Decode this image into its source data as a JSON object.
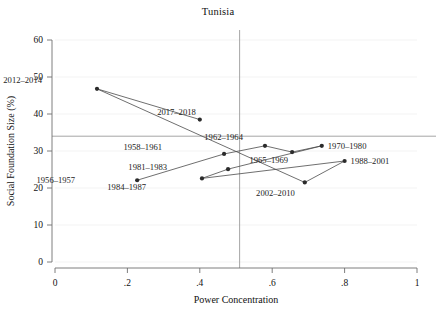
{
  "chart_data": {
    "type": "scatter",
    "title": "Tunisia",
    "xlabel": "Power Concentration",
    "ylabel": "Social Foundation Size (%)",
    "xlim": [
      0,
      1
    ],
    "ylim": [
      0,
      60
    ],
    "xticks": [
      0,
      0.2,
      0.4,
      0.6,
      0.8,
      1
    ],
    "xticklabels": [
      "0",
      ".2",
      ".4",
      ".6",
      ".8",
      "1"
    ],
    "yticks": [
      0,
      10,
      20,
      30,
      40,
      50,
      60
    ],
    "yticklabels": [
      "0",
      "10",
      "20",
      "30",
      "40",
      "50",
      "60"
    ],
    "grid": "light horizontal gridlines",
    "legend": "none — points labeled inline",
    "reference_lines": {
      "horizontal_y": 34,
      "vertical_x": 0.51
    },
    "connected": true,
    "connection_note": "points joined in chronological order of period",
    "points": [
      {
        "label": "1956–1957",
        "x": 0.227,
        "y": 22.1,
        "label_dx": -62,
        "label_dy": 3
      },
      {
        "label": "1958–1961",
        "x": 0.467,
        "y": 29.2,
        "label_dx": -62,
        "label_dy": -4
      },
      {
        "label": "1962–1964",
        "x": 0.58,
        "y": 31.4,
        "label_dx": -22,
        "label_dy": -6
      },
      {
        "label": "1965–1969",
        "x": 0.655,
        "y": 29.7,
        "label_dx": -4,
        "label_dy": 11
      },
      {
        "label": "1970–1980",
        "x": 0.737,
        "y": 31.4,
        "label_dx": 6,
        "label_dy": 3
      },
      {
        "label": "1981–1983",
        "x": 0.478,
        "y": 25.1,
        "label_dx": -61,
        "label_dy": 1
      },
      {
        "label": "1984–1987",
        "x": 0.406,
        "y": 22.6,
        "label_dx": -56,
        "label_dy": 12
      },
      {
        "label": "1988–2001",
        "x": 0.8,
        "y": 27.3,
        "label_dx": 6,
        "label_dy": 3
      },
      {
        "label": "2002–2010",
        "x": 0.69,
        "y": 21.5,
        "label_dx": -10,
        "label_dy": 14
      },
      {
        "label": "2012–2014",
        "x": 0.116,
        "y": 46.8,
        "label_dx": -55,
        "label_dy": -6
      },
      {
        "label": "2017–2018",
        "x": 0.4,
        "y": 38.5,
        "label_dx": -4,
        "label_dy": -5
      }
    ],
    "series_order": [
      "1956–1957",
      "1958–1961",
      "1962–1964",
      "1965–1969",
      "1970–1980",
      "1981–1983",
      "1984–1987",
      "1988–2001",
      "2002–2010",
      "2012–2014",
      "2017–2018"
    ],
    "colors": {
      "point": "#2b2b2b",
      "line": "#4a4a4a",
      "axis": "#6f6f6f",
      "reference": "#9b9b9b",
      "grid": "#f0f0f0",
      "background": "#ffffff",
      "text": "#111111"
    }
  }
}
